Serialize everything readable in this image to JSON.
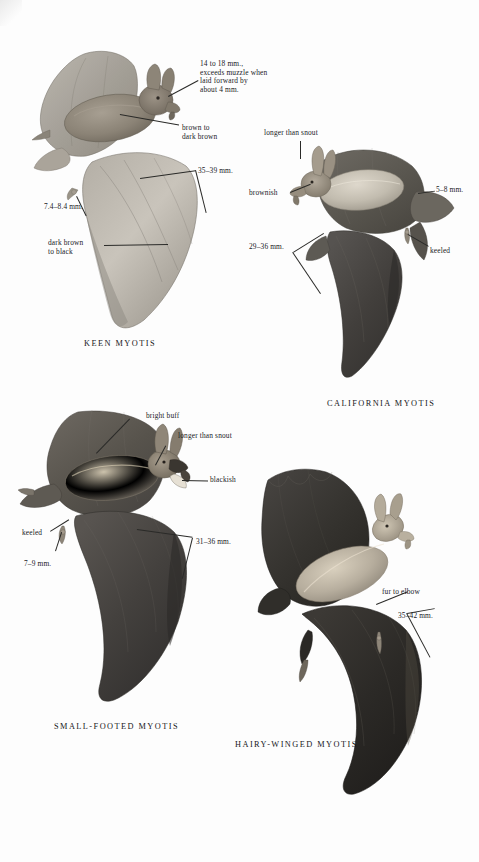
{
  "page": {
    "kind": "field-guide-plate",
    "background": "#fdfdfd",
    "ink": "#20201e"
  },
  "figures": [
    {
      "id": "keen-myotis",
      "caption": "KEEN MYOTIS",
      "annotations": [
        {
          "id": "ear-length",
          "text": "14 to 18 mm.,\nexceeds muzzle when\nlaid forward by\nabout 4 mm."
        },
        {
          "id": "fur-color",
          "text": "brown to\ndark brown"
        },
        {
          "id": "forearm",
          "text": "35–39 mm."
        },
        {
          "id": "foot",
          "text": "7.4–8.4 mm."
        },
        {
          "id": "wing-color",
          "text": "dark brown\nto black"
        }
      ]
    },
    {
      "id": "california-myotis",
      "caption": "CALIFORNIA MYOTIS",
      "annotations": [
        {
          "id": "ear-vs-snout",
          "text": "longer than snout"
        },
        {
          "id": "fur-color",
          "text": "brownish"
        },
        {
          "id": "forearm",
          "text": "29–36 mm."
        },
        {
          "id": "foot",
          "text": "5–8 mm."
        },
        {
          "id": "calcar",
          "text": "keeled"
        }
      ]
    },
    {
      "id": "small-footed-myotis",
      "caption": "SMALL-FOOTED MYOTIS",
      "annotations": [
        {
          "id": "fur-color",
          "text": "bright buff"
        },
        {
          "id": "ear-vs-snout",
          "text": "longer than snout"
        },
        {
          "id": "mask",
          "text": "blackish"
        },
        {
          "id": "calcar",
          "text": "keeled"
        },
        {
          "id": "foot",
          "text": "7–9 mm."
        },
        {
          "id": "forearm",
          "text": "31–36 mm."
        }
      ]
    },
    {
      "id": "hairy-winged-myotis",
      "caption": "HAIRY-WINGED MYOTIS",
      "annotations": [
        {
          "id": "fur-extent",
          "text": "fur to elbow"
        },
        {
          "id": "forearm",
          "text": "35–42 mm."
        }
      ]
    }
  ]
}
